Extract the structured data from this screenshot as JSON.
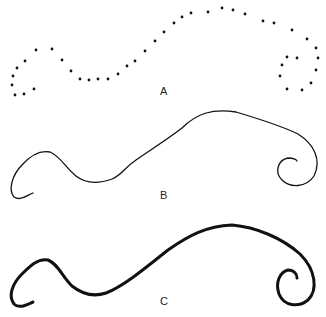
{
  "figure": {
    "panels": [
      {
        "label": "A",
        "style": "dotted",
        "label_pos": [
          162,
          86
        ]
      },
      {
        "label": "B",
        "style": "thin line",
        "label_pos": [
          162,
          189
        ]
      },
      {
        "label": "C",
        "style": "thick line",
        "label_pos": [
          162,
          298
        ]
      }
    ],
    "colors": {
      "stroke": "#111111",
      "background": "#ffffff"
    }
  }
}
